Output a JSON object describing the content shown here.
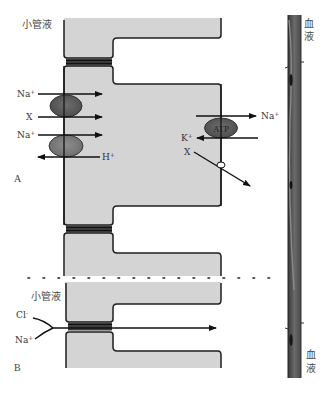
{
  "figure": {
    "panel_a": {
      "label": "A",
      "lumen_label": "小管液",
      "blood_label_top": [
        "血",
        "液"
      ],
      "apical_transporters": [
        {
          "ion": "Na",
          "charge": "+",
          "direction": "into-cell",
          "carrier": "cotransporter-1"
        },
        {
          "ion": "X",
          "charge": "",
          "direction": "into-cell",
          "carrier": "cotransporter-1"
        },
        {
          "ion": "Na",
          "charge": "+",
          "direction": "into-cell",
          "carrier": "exchanger-2"
        },
        {
          "ion": "H",
          "charge": "+",
          "direction": "out-of-cell",
          "carrier": "exchanger-2"
        }
      ],
      "basolateral_pump": {
        "label": "ATP",
        "out_ion": {
          "ion": "Na",
          "charge": "+"
        },
        "in_ion": {
          "ion": "K",
          "charge": "+"
        }
      },
      "basolateral_channel": {
        "ion": "X",
        "charge": ""
      }
    },
    "panel_b": {
      "label": "B",
      "lumen_label": "小管液",
      "paracellular_ions": [
        {
          "ion": "Cl",
          "charge": "-"
        },
        {
          "ion": "Na",
          "charge": "+"
        }
      ],
      "blood_label_bottom": [
        "血",
        "液"
      ]
    },
    "colors": {
      "cell_fill": "#d4d4d4",
      "membrane": "#1e1e1e",
      "cotransporter_dark": "#5a5a5a",
      "exchanger": "#7a7a7a",
      "pump": "#666666",
      "vessel": "#555555"
    }
  }
}
